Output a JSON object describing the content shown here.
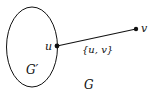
{
  "diagram": {
    "subgraph_label": "G′",
    "graph_label": "G",
    "nodes": [
      {
        "id": "u",
        "label": "u"
      },
      {
        "id": "v",
        "label": "v"
      }
    ],
    "edge": {
      "from": "u",
      "to": "v",
      "label": "{u, v}"
    },
    "colors": {
      "stroke": "#111111",
      "background": "#ffffff"
    }
  }
}
